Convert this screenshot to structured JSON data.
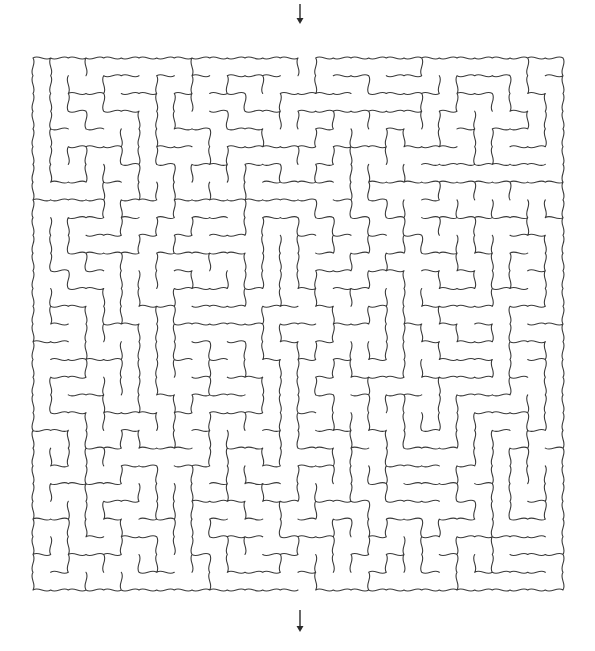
{
  "puzzle": {
    "type": "maze",
    "style": "wavy-walls",
    "grid": {
      "cols": 30,
      "rows": 30
    },
    "bounds": {
      "x0": 33,
      "y0": 58,
      "x1": 563,
      "y1": 590
    },
    "entry": {
      "side": "top",
      "col": 15,
      "arrow": {
        "x": 300,
        "y_from": 4,
        "y_to": 24
      }
    },
    "exit": {
      "side": "bottom",
      "col": 15,
      "arrow": {
        "x": 300,
        "y_from": 610,
        "y_to": 632
      }
    },
    "colors": {
      "wall": "#3a3a3a",
      "arrow": "#2a2a2a",
      "background": "#ffffff"
    },
    "wave_amplitude": 2.6,
    "seed": 7331
  }
}
